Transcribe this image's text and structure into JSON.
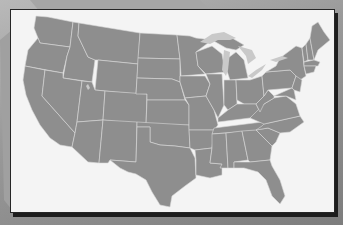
{
  "map": {
    "subject": "Contiguous United States",
    "style": "grayscale state outline map",
    "colors": {
      "land": "#8e8e8e",
      "borders": "#d8d8d8",
      "lakes": "#c9c9c9",
      "panel": "#f4f4f4",
      "frame": "#262626",
      "background": "#9a9a9a"
    },
    "features": [
      "state-borders",
      "great-lakes",
      "great-salt-lake"
    ]
  }
}
